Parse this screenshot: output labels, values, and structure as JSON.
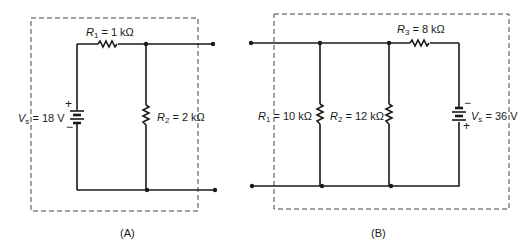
{
  "figure": {
    "panels": [
      {
        "id": "A",
        "caption": "(A)",
        "source": {
          "symbol": "V",
          "subscript": "s",
          "value": "= 18 V",
          "plus": "+",
          "minus": "−"
        },
        "resistors": [
          {
            "symbol": "R",
            "subscript": "1",
            "value": "= 1 kΩ",
            "placement": "series-top"
          },
          {
            "symbol": "R",
            "subscript": "2",
            "value": "= 2 kΩ",
            "placement": "shunt"
          }
        ]
      },
      {
        "id": "B",
        "caption": "(B)",
        "source": {
          "symbol": "V",
          "subscript": "s",
          "value": "= 36 V",
          "plus": "+",
          "minus": "−"
        },
        "resistors": [
          {
            "symbol": "R",
            "subscript": "1",
            "value": "= 10 kΩ",
            "placement": "shunt"
          },
          {
            "symbol": "R",
            "subscript": "2",
            "value": "= 12 kΩ",
            "placement": "shunt"
          },
          {
            "symbol": "R",
            "subscript": "3",
            "value": "= 8 kΩ",
            "placement": "series-top"
          }
        ]
      }
    ],
    "colors": {
      "line": "#1a1a1a",
      "dashed_box": "#444444",
      "background": "#ffffff"
    }
  }
}
